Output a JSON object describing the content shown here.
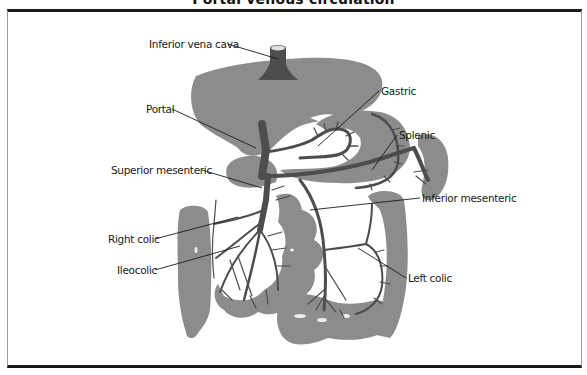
{
  "figure": {
    "title": "Portal venous circulation",
    "colors": {
      "organ": "#8c8c8c",
      "vein": "#4d4d4d",
      "leader": "#1a1a1a",
      "frame": "#1a1a1a",
      "background": "#ffffff"
    }
  },
  "labels": {
    "inferior_vena_cava": "Inferior vena cava",
    "portal": "Portal",
    "gastric": "Gastric",
    "splenic": "Splenic",
    "superior_mesenteric": "Superior mesenteric",
    "inferior_mesenteric": "Inferior mesenteric",
    "right_colic": "Right colic",
    "ileocolic": "Ileocolic",
    "left_colic": "Left colic"
  },
  "structures": [
    "liver",
    "stomach",
    "spleen",
    "duodenum",
    "ascending-colon",
    "small-intestine",
    "descending-colon",
    "sigmoid-colon"
  ]
}
